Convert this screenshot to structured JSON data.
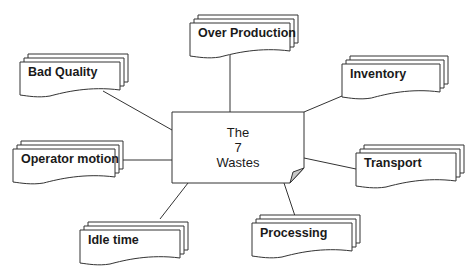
{
  "diagram": {
    "title_lines": [
      "The",
      "7",
      "Wastes"
    ],
    "wastes": [
      {
        "id": "over-production",
        "label": "Over Production"
      },
      {
        "id": "bad-quality",
        "label": "Bad Quality"
      },
      {
        "id": "inventory",
        "label": "Inventory"
      },
      {
        "id": "operator-motion",
        "label": "Operator motion"
      },
      {
        "id": "transport",
        "label": "Transport"
      },
      {
        "id": "idle-time",
        "label": "Idle time"
      },
      {
        "id": "processing",
        "label": "Processing"
      }
    ],
    "colors": {
      "stroke": "#333333",
      "fold": "#c8c8c8",
      "background": "#ffffff"
    }
  }
}
